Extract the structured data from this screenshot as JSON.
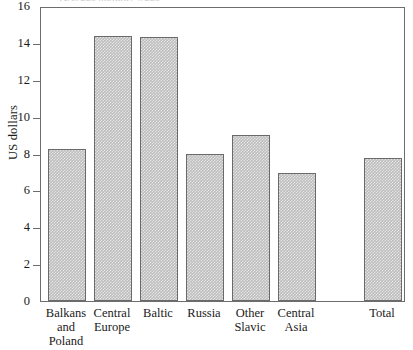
{
  "figure": {
    "title_remnant": "Average monthly wage",
    "axis_label_y": "US dollars"
  },
  "chart_data": {
    "type": "bar",
    "title": "",
    "xlabel": "",
    "ylabel": "US dollars",
    "ylim": [
      0,
      16
    ],
    "ytick_values": [
      0,
      2,
      4,
      6,
      8,
      10,
      12,
      14,
      16
    ],
    "ytick_labels": [
      "0",
      "2",
      "4",
      "6",
      "8",
      "10",
      "12",
      "14",
      "16"
    ],
    "grid": false,
    "legend": null,
    "categories": [
      "Balkans\nand\nPoland",
      "Central\nEurope",
      "Baltic",
      "Russia",
      "Other\nSlavic",
      "Central\nAsia",
      "Total"
    ],
    "values": [
      8.25,
      14.4,
      14.3,
      8.0,
      9.0,
      6.95,
      7.75
    ],
    "bar_color": "#bdbdbd",
    "bar_edge_color": "#6a6a6a"
  }
}
